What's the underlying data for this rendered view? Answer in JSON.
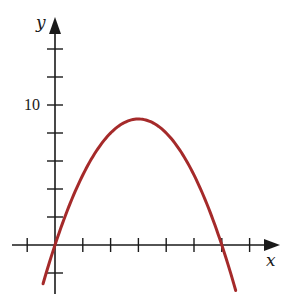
{
  "chart_data": {
    "type": "line",
    "title": "",
    "xlabel": "x",
    "ylabel": "y",
    "function": "y = 6x - x^2",
    "x_tick_step": 1,
    "y_tick_step": 2,
    "x_ticks": [
      -1,
      0,
      1,
      2,
      3,
      4,
      5,
      6,
      7
    ],
    "y_ticks": [
      -2,
      0,
      2,
      4,
      6,
      8,
      10,
      12,
      14
    ],
    "y_tick_labels": [
      {
        "value": 10,
        "label": "10"
      }
    ],
    "xlim": [
      -1.5,
      8
    ],
    "ylim": [
      -3.8,
      16
    ],
    "grid": false,
    "legend": null,
    "series": [
      {
        "name": "parabola",
        "color": "#a52a2a",
        "x": [
          -0.43,
          0,
          0.5,
          1,
          1.5,
          2,
          2.5,
          3,
          3.5,
          4,
          4.5,
          5,
          5.5,
          6,
          6.5
        ],
        "y": [
          -2.76,
          0,
          2.75,
          5,
          6.75,
          8,
          8.75,
          9,
          8.75,
          8,
          6.75,
          5,
          2.75,
          0,
          -3.25
        ]
      }
    ],
    "annotations": [
      {
        "text": "10",
        "at": "y-axis tick 10"
      },
      {
        "text": "x",
        "at": "x-axis end"
      },
      {
        "text": "y",
        "at": "y-axis top"
      }
    ]
  },
  "labels": {
    "x_axis": "x",
    "y_axis": "y",
    "y_ten": "10"
  },
  "colors": {
    "curve": "#a52a2a",
    "axes": "#1a1a1a",
    "background": "#ffffff"
  }
}
